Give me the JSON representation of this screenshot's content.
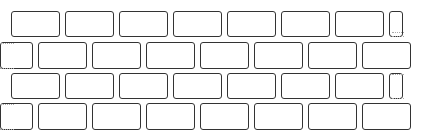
{
  "illustration": {
    "subject": "brick-wall",
    "style": "hand-drawn line art",
    "stroke_color": "#333333",
    "background": "#ffffff",
    "rows": [
      {
        "y": 11,
        "h": 26,
        "bricks": [
          [
            11,
            49
          ],
          [
            65,
            49
          ],
          [
            119,
            49
          ],
          [
            173,
            49
          ],
          [
            227,
            49
          ],
          [
            281,
            49
          ],
          [
            335,
            49
          ],
          [
            389,
            14
          ]
        ],
        "dashes": [
          [
            392,
            32,
            12
          ],
          [
            392,
            36,
            12
          ]
        ]
      },
      {
        "y": 42,
        "h": 27,
        "bricks": [
          [
            0,
            33
          ],
          [
            38,
            49
          ],
          [
            92,
            49
          ],
          [
            146,
            49
          ],
          [
            200,
            49
          ],
          [
            254,
            49
          ],
          [
            308,
            49
          ],
          [
            362,
            49
          ]
        ],
        "dashes": [
          [
            0,
            43,
            14
          ],
          [
            0,
            68,
            14
          ]
        ]
      },
      {
        "y": 73,
        "h": 26,
        "bricks": [
          [
            11,
            49
          ],
          [
            65,
            49
          ],
          [
            119,
            49
          ],
          [
            173,
            49
          ],
          [
            227,
            49
          ],
          [
            281,
            49
          ],
          [
            335,
            49
          ],
          [
            389,
            14
          ]
        ],
        "dashes": [
          [
            392,
            74,
            12
          ],
          [
            392,
            98,
            12
          ]
        ]
      },
      {
        "y": 103,
        "h": 27,
        "bricks": [
          [
            0,
            33
          ],
          [
            38,
            49
          ],
          [
            92,
            49
          ],
          [
            146,
            49
          ],
          [
            200,
            49
          ],
          [
            254,
            49
          ],
          [
            308,
            49
          ],
          [
            362,
            49
          ]
        ],
        "dashes": [
          [
            0,
            104,
            14
          ],
          [
            0,
            129,
            14
          ]
        ]
      }
    ]
  }
}
